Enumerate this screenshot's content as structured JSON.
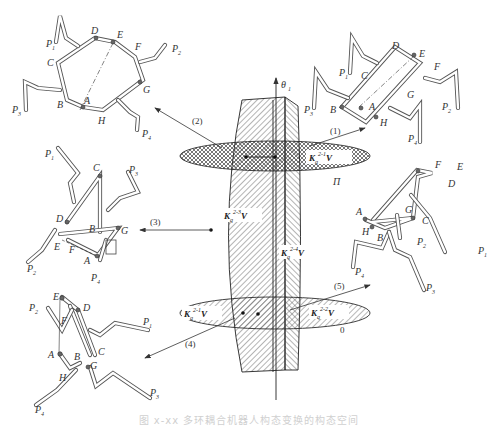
{
  "figure": {
    "caption": "图 x-xx  多环耦合机器人构态变换的构态空间",
    "axis": {
      "label": "θ",
      "sub": "1"
    },
    "plane_label": "Π",
    "zero_label": "0",
    "colors": {
      "line": "#333333",
      "hatch": "#555555",
      "background": "#ffffff"
    }
  },
  "regions": [
    {
      "id": "K21",
      "label": "K",
      "sub": "q",
      "sup": "2-1",
      "tail": "V",
      "location": "upper-plane-right"
    },
    {
      "id": "K23",
      "label": "K",
      "sub": "q",
      "sup": "2-3",
      "tail": "V",
      "location": "central-surface-left"
    },
    {
      "id": "K24",
      "label": "K",
      "sub": "q",
      "sup": "2-4",
      "tail": "V",
      "location": "central-surface-right"
    },
    {
      "id": "K21b",
      "label": "K",
      "sub": "q",
      "sup": "2-1",
      "tail": "V",
      "location": "lower-plane-left"
    },
    {
      "id": "K22",
      "label": "K",
      "sub": "q",
      "sup": "2-2",
      "tail": "V",
      "location": "lower-plane-right"
    }
  ],
  "transitions": [
    {
      "label": "(1)",
      "direction": "to upper-right configuration"
    },
    {
      "label": "(2)",
      "direction": "to upper-left configuration"
    },
    {
      "label": "(3)",
      "direction": "to middle-left configuration"
    },
    {
      "label": "(4)",
      "direction": "to lower-left configuration"
    },
    {
      "label": "(5)",
      "direction": "to middle-right configuration"
    }
  ],
  "configurations": [
    {
      "id": "upper-left",
      "joints": [
        "A",
        "B",
        "C",
        "D",
        "E",
        "F",
        "G",
        "H"
      ],
      "feet": [
        "P1",
        "P2",
        "P3",
        "P4"
      ]
    },
    {
      "id": "upper-right",
      "joints": [
        "A",
        "B",
        "C",
        "D",
        "E",
        "F",
        "G",
        "H"
      ],
      "feet": [
        "P1",
        "P2",
        "P3",
        "P4"
      ]
    },
    {
      "id": "middle-left",
      "joints": [
        "A",
        "B",
        "C",
        "D",
        "E",
        "F",
        "G"
      ],
      "feet": [
        "P1",
        "P2",
        "P3",
        "P4"
      ]
    },
    {
      "id": "middle-right",
      "joints": [
        "A",
        "B",
        "C",
        "D",
        "E",
        "F",
        "G",
        "H"
      ],
      "feet": [
        "P1",
        "P2",
        "P3",
        "P4"
      ]
    },
    {
      "id": "lower-left",
      "joints": [
        "A",
        "B",
        "C",
        "D",
        "E",
        "F",
        "G",
        "H"
      ],
      "feet": [
        "P1",
        "P2",
        "P3",
        "P4"
      ]
    }
  ],
  "labels": {
    "A": "A",
    "B": "B",
    "C": "C",
    "D": "D",
    "E": "E",
    "F": "F",
    "G": "G",
    "H": "H",
    "P": "P",
    "s1": "1",
    "s2": "2",
    "s3": "3",
    "s4": "4",
    "t1": "(1)",
    "t2": "(2)",
    "t3": "(3)",
    "t4": "(4)",
    "t5": "(5)",
    "K": "K",
    "q": "q",
    "V": "V",
    "sup21": "2-1",
    "sup22": "2-2",
    "sup23": "2-3",
    "sup24": "2-4"
  }
}
